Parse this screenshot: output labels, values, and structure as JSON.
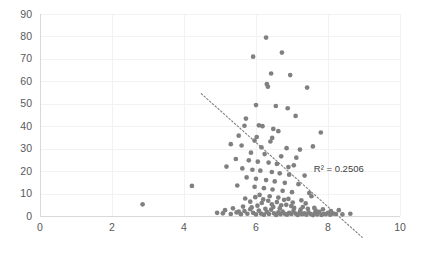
{
  "chart_data": {
    "type": "scatter",
    "title": "",
    "subtitle": "",
    "xlabel": "",
    "ylabel": "",
    "xlim": [
      0,
      10
    ],
    "ylim": [
      0,
      90
    ],
    "xticks": [
      0,
      2,
      4,
      6,
      8,
      10
    ],
    "yticks": [
      0,
      10,
      20,
      30,
      40,
      50,
      60,
      70,
      80,
      90
    ],
    "grid": true,
    "legend": false,
    "legend_position": "none",
    "marker_color": "#808080",
    "gridline_color": "#f2f2f2",
    "axis_color": "#d9d9d9",
    "trendline_color": "#7f7f7f",
    "annotations": [
      {
        "name": "r-squared-label",
        "text": "R² = 0.2506",
        "x": 8.3,
        "y": 19.5
      }
    ],
    "trendline": {
      "style": "dotted",
      "x_start": 4.48,
      "y_start": 54.5,
      "x_end": 8.95,
      "y_end": -9.5
    },
    "series": [
      {
        "name": "observations",
        "points": [
          [
            2.85,
            5.2
          ],
          [
            4.22,
            13.4
          ],
          [
            6.28,
            79.5
          ],
          [
            6.72,
            72.8
          ],
          [
            5.92,
            71.0
          ],
          [
            6.42,
            63.5
          ],
          [
            6.95,
            62.8
          ],
          [
            6.3,
            58.8
          ],
          [
            6.33,
            57.6
          ],
          [
            7.42,
            57.2
          ],
          [
            6.0,
            49.4
          ],
          [
            6.55,
            49.0
          ],
          [
            6.88,
            48.0
          ],
          [
            7.1,
            44.6
          ],
          [
            5.72,
            43.4
          ],
          [
            5.68,
            40.2
          ],
          [
            6.08,
            40.4
          ],
          [
            6.18,
            40.0
          ],
          [
            6.48,
            38.8
          ],
          [
            6.62,
            37.8
          ],
          [
            7.8,
            37.2
          ],
          [
            5.52,
            35.8
          ],
          [
            6.02,
            35.2
          ],
          [
            6.45,
            34.8
          ],
          [
            5.96,
            33.6
          ],
          [
            6.4,
            33.2
          ],
          [
            5.3,
            32.0
          ],
          [
            5.6,
            31.4
          ],
          [
            6.15,
            30.6
          ],
          [
            6.85,
            30.2
          ],
          [
            7.22,
            29.6
          ],
          [
            5.86,
            28.2
          ],
          [
            6.24,
            27.6
          ],
          [
            6.7,
            26.6
          ],
          [
            5.44,
            25.4
          ],
          [
            5.8,
            24.8
          ],
          [
            6.05,
            24.2
          ],
          [
            6.35,
            23.8
          ],
          [
            6.58,
            23.2
          ],
          [
            7.05,
            22.6
          ],
          [
            5.18,
            22.0
          ],
          [
            5.62,
            21.2
          ],
          [
            5.9,
            20.6
          ],
          [
            6.12,
            20.2
          ],
          [
            6.44,
            19.6
          ],
          [
            6.66,
            19.0
          ],
          [
            6.92,
            18.4
          ],
          [
            7.35,
            18.0
          ],
          [
            5.74,
            17.2
          ],
          [
            6.0,
            16.6
          ],
          [
            6.28,
            16.0
          ],
          [
            6.52,
            15.4
          ],
          [
            6.8,
            14.8
          ],
          [
            7.18,
            14.2
          ],
          [
            5.48,
            13.6
          ],
          [
            5.96,
            13.0
          ],
          [
            6.22,
            12.4
          ],
          [
            6.46,
            11.8
          ],
          [
            6.74,
            11.2
          ],
          [
            7.0,
            10.6
          ],
          [
            7.48,
            10.2
          ],
          [
            6.1,
            9.4
          ],
          [
            6.38,
            8.8
          ],
          [
            6.62,
            8.2
          ],
          [
            6.9,
            7.6
          ],
          [
            7.26,
            7.0
          ],
          [
            5.84,
            6.4
          ],
          [
            6.16,
            5.8
          ],
          [
            6.44,
            5.2
          ],
          [
            6.7,
            4.8
          ],
          [
            6.98,
            4.4
          ],
          [
            7.3,
            4.0
          ],
          [
            7.62,
            3.6
          ],
          [
            4.92,
            1.4
          ],
          [
            5.08,
            1.2
          ],
          [
            5.3,
            0.9
          ],
          [
            5.46,
            1.6
          ],
          [
            5.58,
            0.8
          ],
          [
            5.68,
            2.2
          ],
          [
            5.76,
            1.0
          ],
          [
            5.84,
            3.0
          ],
          [
            5.92,
            1.4
          ],
          [
            6.0,
            0.7
          ],
          [
            6.08,
            2.4
          ],
          [
            6.14,
            1.1
          ],
          [
            6.22,
            0.6
          ],
          [
            6.3,
            1.8
          ],
          [
            6.36,
            0.9
          ],
          [
            6.42,
            2.8
          ],
          [
            6.5,
            1.2
          ],
          [
            6.56,
            0.5
          ],
          [
            6.62,
            1.6
          ],
          [
            6.68,
            0.8
          ],
          [
            6.74,
            2.0
          ],
          [
            6.8,
            1.0
          ],
          [
            6.86,
            0.6
          ],
          [
            6.92,
            1.4
          ],
          [
            6.98,
            0.9
          ],
          [
            7.04,
            2.2
          ],
          [
            7.1,
            1.1
          ],
          [
            7.16,
            0.5
          ],
          [
            7.22,
            1.8
          ],
          [
            7.28,
            0.8
          ],
          [
            7.34,
            1.2
          ],
          [
            7.4,
            0.6
          ],
          [
            7.46,
            1.6
          ],
          [
            7.52,
            0.9
          ],
          [
            7.58,
            0.4
          ],
          [
            7.64,
            1.3
          ],
          [
            7.7,
            0.7
          ],
          [
            7.76,
            1.9
          ],
          [
            7.82,
            0.5
          ],
          [
            7.88,
            1.0
          ],
          [
            7.94,
            0.8
          ],
          [
            8.0,
            1.4
          ],
          [
            8.06,
            0.6
          ],
          [
            8.14,
            1.1
          ],
          [
            8.22,
            0.9
          ],
          [
            8.3,
            2.6
          ],
          [
            8.4,
            0.7
          ],
          [
            8.62,
            1.0
          ],
          [
            5.14,
            2.6
          ],
          [
            5.36,
            3.4
          ],
          [
            5.52,
            2.0
          ],
          [
            5.64,
            4.2
          ],
          [
            5.88,
            3.8
          ],
          [
            6.04,
            4.6
          ],
          [
            6.26,
            3.2
          ],
          [
            6.48,
            4.0
          ],
          [
            6.66,
            3.4
          ],
          [
            6.84,
            5.0
          ],
          [
            7.06,
            3.6
          ],
          [
            7.24,
            2.8
          ],
          [
            7.44,
            3.2
          ],
          [
            7.66,
            2.4
          ],
          [
            7.86,
            3.0
          ],
          [
            8.08,
            2.2
          ],
          [
            6.34,
            6.8
          ],
          [
            6.58,
            6.2
          ],
          [
            6.78,
            7.2
          ],
          [
            7.02,
            6.0
          ],
          [
            7.38,
            5.6
          ],
          [
            5.7,
            7.8
          ],
          [
            5.98,
            8.4
          ],
          [
            6.2,
            7.4
          ],
          [
            7.54,
            8.8
          ],
          [
            6.9,
            21.8
          ],
          [
            7.12,
            26.0
          ],
          [
            7.58,
            31.0
          ]
        ]
      }
    ]
  }
}
